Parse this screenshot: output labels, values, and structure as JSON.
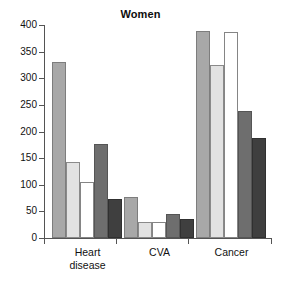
{
  "chart_data": {
    "type": "bar",
    "title": "Women",
    "xlabel": "",
    "ylabel": "",
    "ylim": [
      0,
      400
    ],
    "yticks": [
      0,
      50,
      100,
      150,
      200,
      250,
      300,
      350,
      400
    ],
    "ytick_labels": [
      "0",
      "50",
      "100",
      "150",
      "200",
      "250",
      "300",
      "350",
      "400"
    ],
    "grid": false,
    "legend": "none",
    "categories": [
      "Heart\ndisease",
      "CVA",
      "Cancer"
    ],
    "category_labels": [
      "Heart disease",
      "CVA",
      "Cancer"
    ],
    "series": [
      {
        "name": "series-1",
        "color": "#a8a8a8",
        "values": [
          330,
          77,
          388
        ]
      },
      {
        "name": "series-2",
        "color": "#e2e2e2",
        "values": [
          143,
          31,
          324
        ]
      },
      {
        "name": "series-3",
        "color": "#ffffff",
        "values": [
          106,
          31,
          386
        ]
      },
      {
        "name": "series-4",
        "color": "#6e6e6e",
        "values": [
          176,
          46,
          238
        ]
      },
      {
        "name": "series-5",
        "color": "#3f3f3f",
        "values": [
          73,
          35,
          188
        ]
      }
    ]
  }
}
